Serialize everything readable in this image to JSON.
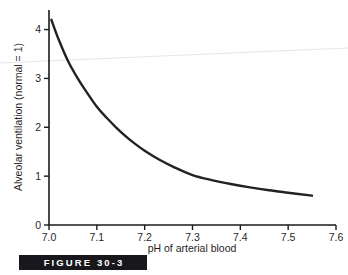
{
  "figure": {
    "caption": "FIGURE 30-3",
    "caption_bg_color": "#18181c",
    "caption_text_color": "#ffffff"
  },
  "chart_data": {
    "type": "line",
    "title": "",
    "xlabel": "pH of arterial blood",
    "ylabel": "Alveolar ventilation (normal = 1)",
    "xlim": [
      7.0,
      7.6
    ],
    "ylim": [
      0,
      4.4
    ],
    "xticks": [
      "7.0",
      "7.1",
      "7.2",
      "7.3",
      "7.4",
      "7.5",
      "7.6"
    ],
    "xtick_values": [
      7.0,
      7.1,
      7.2,
      7.3,
      7.4,
      7.5,
      7.6
    ],
    "yticks": [
      "0",
      "1",
      "2",
      "3",
      "4"
    ],
    "ytick_values": [
      0,
      1,
      2,
      3,
      4
    ],
    "grid": false,
    "legend": false,
    "line_color": "#222222",
    "line_width": 2.4,
    "series": [
      {
        "name": "Alveolar ventilation vs arterial pH",
        "x": [
          7.005,
          7.02,
          7.04,
          7.06,
          7.08,
          7.1,
          7.12,
          7.14,
          7.16,
          7.18,
          7.2,
          7.23,
          7.26,
          7.3,
          7.34,
          7.38,
          7.42,
          7.46,
          7.5,
          7.55
        ],
        "y": [
          4.2,
          3.8,
          3.35,
          3.0,
          2.7,
          2.42,
          2.2,
          2.0,
          1.82,
          1.66,
          1.52,
          1.34,
          1.19,
          1.02,
          0.92,
          0.84,
          0.77,
          0.71,
          0.66,
          0.6
        ]
      }
    ],
    "annotations": []
  },
  "artifact": {
    "name": "scan-artifact-line",
    "color": "#e6e6e6"
  }
}
